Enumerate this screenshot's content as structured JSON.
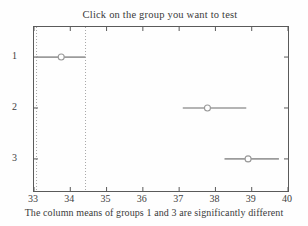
{
  "title": "Click on the group you want to test",
  "xlabel": "The column means of groups 1 and 3 are significantly different",
  "chart_data": {
    "type": "scatter",
    "subtype": "multcompare-interval-plot",
    "title": "Click on the group you want to test",
    "xlabel": "The column means of groups 1 and 3 are significantly different",
    "ylabel": "",
    "xlim": [
      33,
      40
    ],
    "x_ticks": [
      33,
      34,
      35,
      36,
      37,
      38,
      39,
      40
    ],
    "y_tick_labels": [
      "1",
      "2",
      "3"
    ],
    "ylim": [
      0.41,
      3.63
    ],
    "y_axis_reversed": true,
    "grid": false,
    "groups": [
      {
        "label": "1",
        "mean": 33.75,
        "ci_low": 33.07,
        "ci_high": 34.42,
        "selected": true
      },
      {
        "label": "2",
        "mean": 37.78,
        "ci_low": 37.1,
        "ci_high": 38.85,
        "selected": false
      },
      {
        "label": "3",
        "mean": 38.9,
        "ci_low": 38.25,
        "ci_high": 39.75,
        "selected": false
      }
    ],
    "reference_lines": [
      33.07,
      34.42
    ],
    "annotation": "dotted vertical lines mark the comparison interval of the selected group 1",
    "colors": {
      "interval_line": "#9b9b9b",
      "marker_edge": "#999999",
      "marker_fill": "#fefefe",
      "reference_line": "#a8a8a8",
      "axis": "#5a5a5a",
      "text": "#3d3d3d",
      "background": "#fefefe"
    }
  }
}
